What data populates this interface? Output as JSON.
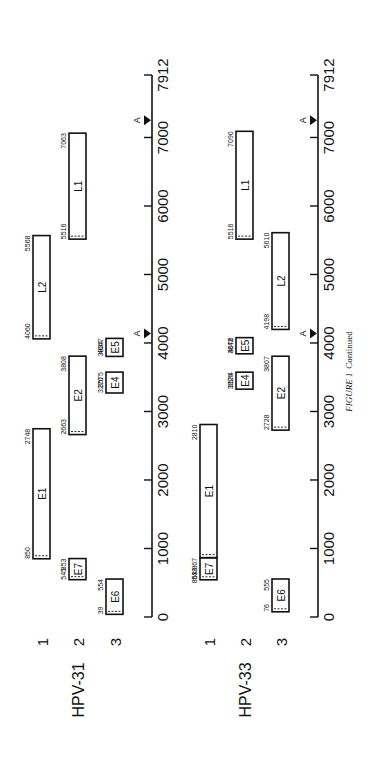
{
  "figure": {
    "caption_label": "FIGURE 1",
    "caption_suffix": "Continued"
  },
  "axis": {
    "max": 7912,
    "ticks": [
      0,
      1000,
      2000,
      3000,
      4000,
      5000,
      6000,
      7000,
      7912
    ],
    "tick_labels": [
      "0",
      "1000",
      "2000",
      "3000",
      "4000",
      "5000",
      "6000",
      "7000",
      "7912"
    ],
    "poly_a_label": "A"
  },
  "genomes": [
    {
      "name": "HPV-31",
      "row_labels": [
        "1",
        "2",
        "3"
      ],
      "poly_a_sites": [
        4140,
        7250
      ],
      "orfs": [
        {
          "name": "E6",
          "row": 3,
          "start": 39,
          "end": 554,
          "start_label": "39",
          "end_label": "554",
          "dashed_start": true
        },
        {
          "name": "E7",
          "row": 2,
          "start": 545,
          "end": 853,
          "start_label": "545",
          "end_label": "853",
          "dashed_start": true
        },
        {
          "name": "E1",
          "row": 1,
          "start": 850,
          "end": 2748,
          "start_label": "850",
          "end_label": "2748",
          "dashed_start": true
        },
        {
          "name": "E2",
          "row": 2,
          "start": 2663,
          "end": 3808,
          "start_label": "2663",
          "end_label": "3808",
          "dashed_start": true
        },
        {
          "name": "E4",
          "row": 3,
          "start": 3270,
          "end": 3575,
          "start_label": "3270",
          "end_label": "3575",
          "dashed_start": false
        },
        {
          "name": "E5",
          "row": 3,
          "start": 3804,
          "end": 4067,
          "start_label": "3804",
          "end_label": "4067",
          "dashed_start": false
        },
        {
          "name": "L2",
          "row": 1,
          "start": 4060,
          "end": 5568,
          "start_label": "4060",
          "end_label": "5568",
          "dashed_start": true
        },
        {
          "name": "L1",
          "row": 2,
          "start": 5516,
          "end": 7063,
          "start_label": "5516",
          "end_label": "7063",
          "dashed_start": true
        }
      ]
    },
    {
      "name": "HPV-33",
      "row_labels": [
        "1",
        "2",
        "3"
      ],
      "poly_a_sites": [
        4140,
        7250
      ],
      "orfs": [
        {
          "name": "E6",
          "row": 3,
          "start": 76,
          "end": 555,
          "start_label": "76",
          "end_label": "555",
          "dashed_start": true
        },
        {
          "name": "E7",
          "row": 1,
          "start": 543,
          "end": 863,
          "start_label": "543",
          "end_label": "863/867",
          "dashed_start": true
        },
        {
          "name": "E1",
          "row": 1,
          "start": 867,
          "end": 2810,
          "start_label": "",
          "end_label": "2810",
          "dashed_start": true
        },
        {
          "name": "E2",
          "row": 3,
          "start": 2728,
          "end": 3807,
          "start_label": "2728",
          "end_label": "3807",
          "dashed_start": true
        },
        {
          "name": "E4",
          "row": 2,
          "start": 3326,
          "end": 3574,
          "start_label": "3326",
          "end_label": "3574",
          "dashed_start": false
        },
        {
          "name": "E5",
          "row": 2,
          "start": 3842,
          "end": 4078,
          "start_label": "3842",
          "end_label": "4078",
          "dashed_start": false
        },
        {
          "name": "L2",
          "row": 3,
          "start": 4198,
          "end": 5610,
          "start_label": "4198",
          "end_label": "5610",
          "dashed_start": true
        },
        {
          "name": "L1",
          "row": 2,
          "start": 5516,
          "end": 7090,
          "start_label": "5516",
          "end_label": "7090",
          "dashed_start": true
        }
      ]
    }
  ]
}
